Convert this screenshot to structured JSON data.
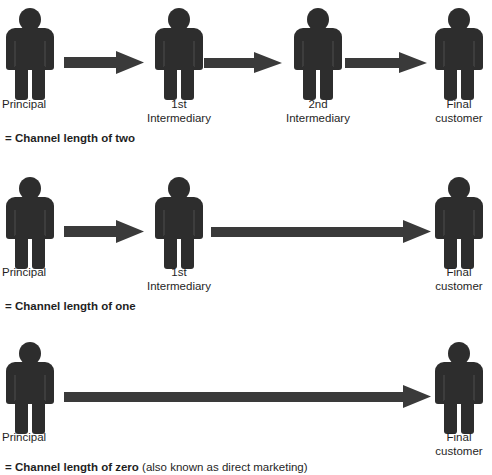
{
  "diagram": {
    "colors": {
      "figure": "#2d2d2d",
      "arrow": "#3a3a3a",
      "text": "#1f1f1f",
      "background": "#ffffff"
    },
    "rows": [
      {
        "id": "channel-length-two",
        "nodes": [
          {
            "id": "principal",
            "label": "Principal"
          },
          {
            "id": "first-intermediary",
            "label": "1st\nIntermediary"
          },
          {
            "id": "second-intermediary",
            "label": "2nd\nIntermediary"
          },
          {
            "id": "final-customer",
            "label": "Final\ncustomer"
          }
        ],
        "arrows": [
          {
            "id": "arrow-principal-to-1st",
            "from": "principal",
            "to": "first-intermediary"
          },
          {
            "id": "arrow-1st-to-2nd",
            "from": "first-intermediary",
            "to": "second-intermediary"
          },
          {
            "id": "arrow-2nd-to-customer",
            "from": "second-intermediary",
            "to": "final-customer"
          }
        ],
        "caption_bold": "= Channel length of two",
        "caption_plain": ""
      },
      {
        "id": "channel-length-one",
        "nodes": [
          {
            "id": "principal",
            "label": "Principal"
          },
          {
            "id": "first-intermediary",
            "label": "1st\nIntermediary"
          },
          {
            "id": "final-customer",
            "label": "Final\ncustomer"
          }
        ],
        "arrows": [
          {
            "id": "arrow-principal-to-1st",
            "from": "principal",
            "to": "first-intermediary"
          },
          {
            "id": "arrow-1st-to-customer",
            "from": "first-intermediary",
            "to": "final-customer"
          }
        ],
        "caption_bold": "= Channel length of one",
        "caption_plain": ""
      },
      {
        "id": "channel-length-zero",
        "nodes": [
          {
            "id": "principal",
            "label": "Principal"
          },
          {
            "id": "final-customer",
            "label": "Final\ncustomer"
          }
        ],
        "arrows": [
          {
            "id": "arrow-principal-to-customer",
            "from": "principal",
            "to": "final-customer"
          }
        ],
        "caption_bold": "= Channel length of zero",
        "caption_plain": " (also known as direct marketing)"
      }
    ]
  }
}
